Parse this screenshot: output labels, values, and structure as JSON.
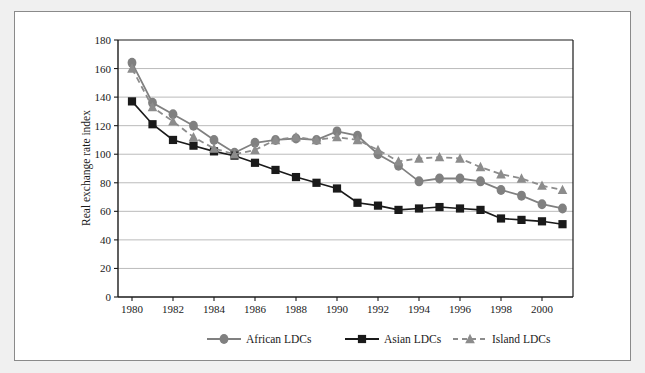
{
  "chart_data": {
    "type": "line",
    "title": "",
    "subtitle": "",
    "xlabel": "",
    "ylabel": "Real exchange rate index",
    "xlim": [
      1980,
      2001
    ],
    "ylim": [
      0,
      180
    ],
    "ytick_step": 20,
    "yticks": [
      0,
      20,
      40,
      60,
      80,
      100,
      120,
      140,
      160,
      180
    ],
    "xticks": [
      1980,
      1982,
      1984,
      1986,
      1988,
      1990,
      1992,
      1994,
      1996,
      1998,
      2000
    ],
    "xtick_labels": [
      "1980",
      "1982",
      "1984",
      "1986",
      "1988",
      "1990",
      "1992",
      "1994",
      "1996",
      "1998",
      "2000"
    ],
    "ytick_labels": [
      "0",
      "20",
      "40",
      "60",
      "80",
      "100",
      "120",
      "140",
      "160",
      "180"
    ],
    "x": [
      1980,
      1981,
      1982,
      1983,
      1984,
      1985,
      1986,
      1987,
      1988,
      1989,
      1990,
      1991,
      1992,
      1993,
      1994,
      1995,
      1996,
      1997,
      1998,
      1999,
      2000,
      2001
    ],
    "grid": "horizontal",
    "legend_position": "bottom",
    "series": [
      {
        "name": "African LDCs",
        "marker": "circle",
        "line_style": "solid",
        "color": "#808080",
        "values": [
          164,
          136,
          128,
          120,
          110,
          101,
          108,
          110,
          111,
          110,
          116,
          113,
          100,
          92,
          81,
          83,
          83,
          81,
          75,
          71,
          65,
          62
        ]
      },
      {
        "name": "Asian LDCs",
        "marker": "square",
        "line_style": "solid",
        "color": "#1a1a1a",
        "values": [
          137,
          121,
          110,
          106,
          102,
          99,
          94,
          89,
          84,
          80,
          76,
          66,
          64,
          61,
          62,
          63,
          62,
          61,
          55,
          54,
          53,
          51
        ]
      },
      {
        "name": "Island LDCs",
        "marker": "triangle",
        "line_style": "dashed",
        "color": "#8c8c8c",
        "values": [
          160,
          133,
          123,
          112,
          104,
          100,
          103,
          110,
          112,
          110,
          112,
          110,
          103,
          95,
          97,
          98,
          97,
          91,
          86,
          83,
          78,
          75
        ]
      }
    ]
  },
  "legend": {
    "items": [
      {
        "label": "African LDCs",
        "marker": "circle",
        "color": "#808080",
        "dash": false
      },
      {
        "label": "Asian LDCs",
        "marker": "square",
        "color": "#1a1a1a",
        "dash": false
      },
      {
        "label": "Island LDCs",
        "marker": "triangle",
        "color": "#8c8c8c",
        "dash": true
      }
    ]
  },
  "colors": {
    "african": "#808080",
    "asian": "#1a1a1a",
    "island": "#8c8c8c",
    "grid": "#b3b3b3",
    "axis": "#1a1a1a",
    "frame": "#8a8a8a",
    "page_background": "#f0f0f0",
    "plot_background": "#ffffff"
  }
}
